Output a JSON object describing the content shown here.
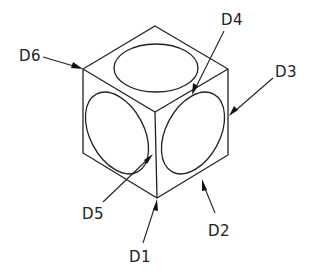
{
  "diagram": {
    "background": "#ffffff",
    "line_color": "#222222",
    "labels": [
      {
        "id": "D1",
        "text": "D1"
      },
      {
        "id": "D2",
        "text": "D2"
      },
      {
        "id": "D3",
        "text": "D3"
      },
      {
        "id": "D4",
        "text": "D4"
      },
      {
        "id": "D5",
        "text": "D5"
      },
      {
        "id": "D6",
        "text": "D6"
      }
    ],
    "faces": [
      "top",
      "left",
      "right"
    ]
  }
}
